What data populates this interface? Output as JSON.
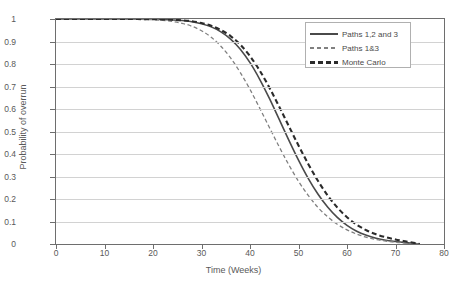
{
  "chart_data": {
    "type": "line",
    "title": "",
    "xlabel": "Time (Weeks)",
    "ylabel": "Probability of overrun",
    "xlim": [
      0,
      80
    ],
    "ylim": [
      0,
      1
    ],
    "xticks": [
      "0",
      "10",
      "20",
      "30",
      "40",
      "50",
      "60",
      "70",
      "80"
    ],
    "yticks": [
      "0",
      "0.1",
      "0.2",
      "0.3",
      "0.4",
      "0.5",
      "0.6",
      "0.7",
      "0.8",
      "0.9",
      "1"
    ],
    "grid": "horizontal",
    "legend_position": "top-right",
    "x": [
      0,
      5,
      10,
      15,
      20,
      22,
      24,
      26,
      28,
      30,
      32,
      34,
      36,
      38,
      40,
      42,
      44,
      46,
      48,
      50,
      52,
      54,
      56,
      58,
      60,
      62,
      64,
      66,
      68,
      70,
      72,
      74,
      75
    ],
    "series": [
      {
        "name": "Paths 1,2 and 3",
        "style": "solid",
        "color": "#4a4a4a",
        "values": [
          1,
          1,
          1,
          1,
          0.999,
          0.998,
          0.996,
          0.993,
          0.988,
          0.979,
          0.965,
          0.943,
          0.911,
          0.866,
          0.806,
          0.732,
          0.647,
          0.555,
          0.462,
          0.373,
          0.292,
          0.222,
          0.164,
          0.118,
          0.083,
          0.057,
          0.039,
          0.026,
          0.017,
          0.011,
          0.006,
          0.002,
          0
        ]
      },
      {
        "name": "Paths 1&3",
        "style": "dashed-thin",
        "color": "#808080",
        "values": [
          1,
          1,
          1,
          0.999,
          0.997,
          0.994,
          0.989,
          0.981,
          0.968,
          0.948,
          0.919,
          0.879,
          0.827,
          0.762,
          0.687,
          0.604,
          0.518,
          0.433,
          0.352,
          0.279,
          0.216,
          0.163,
          0.121,
          0.088,
          0.063,
          0.044,
          0.03,
          0.02,
          0.013,
          0.008,
          0.004,
          0.001,
          0
        ]
      },
      {
        "name": "Monte Carlo",
        "style": "dashed-thick",
        "color": "#2b2b2b",
        "values": [
          1,
          1,
          1,
          1,
          0.999,
          0.998,
          0.997,
          0.994,
          0.99,
          0.982,
          0.97,
          0.951,
          0.924,
          0.886,
          0.835,
          0.771,
          0.695,
          0.611,
          0.524,
          0.438,
          0.356,
          0.281,
          0.216,
          0.162,
          0.119,
          0.086,
          0.061,
          0.043,
          0.03,
          0.02,
          0.012,
          0.004,
          0
        ]
      }
    ]
  },
  "legend": {
    "items": [
      {
        "label": "Paths 1,2 and 3"
      },
      {
        "label": "Paths 1&3"
      },
      {
        "label": "Monte Carlo"
      }
    ]
  }
}
